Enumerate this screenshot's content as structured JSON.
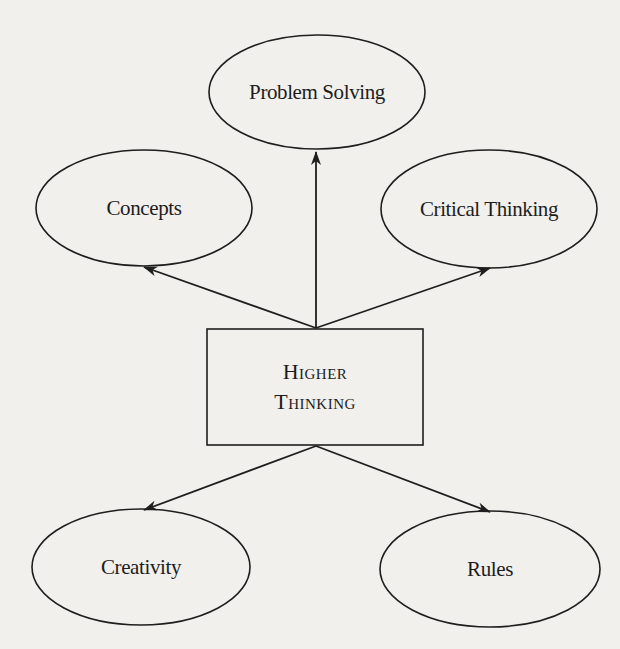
{
  "diagram": {
    "center": {
      "line1": "Higher",
      "line2": "Thinking"
    },
    "nodes": {
      "top": {
        "label": "Problem Solving"
      },
      "upper_left": {
        "label": "Concepts"
      },
      "upper_right": {
        "label": "Critical Thinking"
      },
      "lower_left": {
        "label": "Creativity"
      },
      "lower_right": {
        "label": "Rules"
      }
    },
    "edges": [
      {
        "from": "Higher Thinking",
        "to": "Problem Solving"
      },
      {
        "from": "Higher Thinking",
        "to": "Concepts"
      },
      {
        "from": "Higher Thinking",
        "to": "Critical Thinking"
      },
      {
        "from": "Higher Thinking",
        "to": "Creativity"
      },
      {
        "from": "Higher Thinking",
        "to": "Rules"
      }
    ],
    "colors": {
      "background": "#f1f0ec",
      "stroke": "#1e1e1e",
      "text": "#1d1d1d"
    }
  }
}
